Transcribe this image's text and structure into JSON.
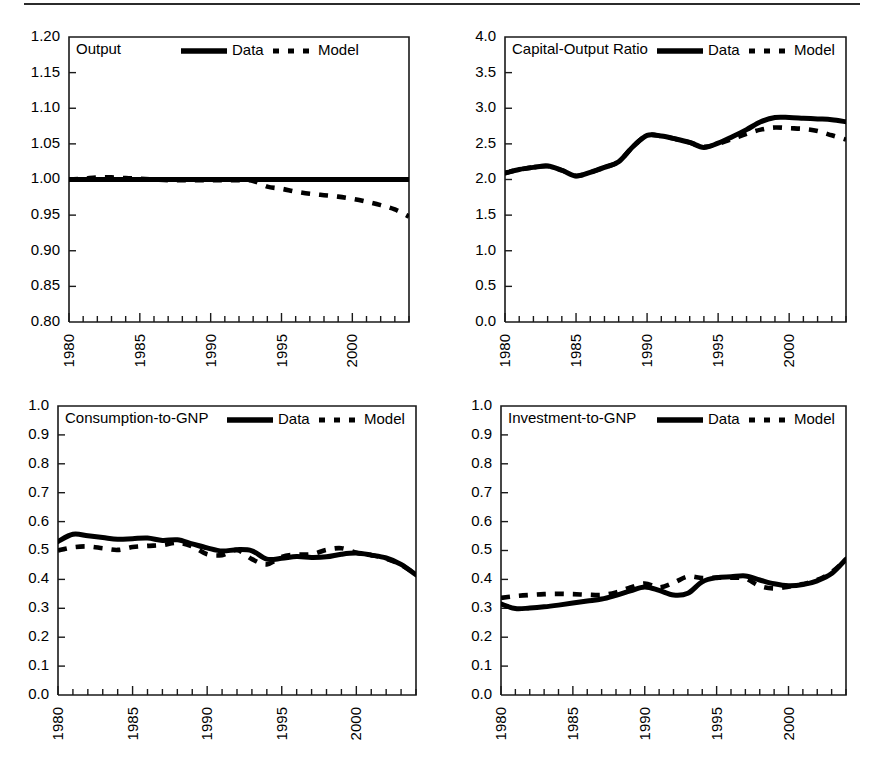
{
  "figure": {
    "top_rule": true,
    "legend": {
      "data_label": "Data",
      "model_label": "Model"
    }
  },
  "chart_data": [
    {
      "id": "output",
      "type": "line",
      "title": "Output",
      "xlabel": "",
      "ylabel": "",
      "xlim": [
        1980,
        2004
      ],
      "ylim": [
        0.8,
        1.2
      ],
      "grid": false,
      "legend_position": "top-center",
      "xticks": [
        1980,
        1985,
        1990,
        1995,
        2000
      ],
      "xtick_labels": [
        "1980",
        "1985",
        "1990",
        "1995",
        "2000"
      ],
      "yticks": [
        0.8,
        0.85,
        0.9,
        0.95,
        1.0,
        1.05,
        1.1,
        1.15,
        1.2
      ],
      "ytick_labels": [
        "0.80",
        "0.85",
        "0.90",
        "0.95",
        "1.00",
        "1.05",
        "1.10",
        "1.15",
        "1.20"
      ],
      "x": [
        1980,
        1981,
        1982,
        1983,
        1984,
        1985,
        1986,
        1987,
        1988,
        1989,
        1990,
        1991,
        1992,
        1993,
        1994,
        1995,
        1996,
        1997,
        1998,
        1999,
        2000,
        2001,
        2002,
        2003,
        2004
      ],
      "series": [
        {
          "name": "Data",
          "style": "solid",
          "values": [
            1.0,
            1.0,
            1.0,
            1.0,
            1.0,
            1.0,
            1.0,
            1.0,
            1.0,
            1.0,
            1.0,
            1.0,
            1.0,
            1.0,
            1.0,
            1.0,
            1.0,
            1.0,
            1.0,
            1.0,
            1.0,
            1.0,
            1.0,
            1.0,
            1.0
          ]
        },
        {
          "name": "Model",
          "style": "dashed",
          "values": [
            1.0,
            1.001,
            1.003,
            1.003,
            1.002,
            1.001,
            1.0,
            0.999,
            0.999,
            0.999,
            0.999,
            0.999,
            0.999,
            0.998,
            0.99,
            0.987,
            0.983,
            0.98,
            0.978,
            0.976,
            0.973,
            0.969,
            0.964,
            0.958,
            0.948
          ]
        }
      ]
    },
    {
      "id": "capital-output-ratio",
      "type": "line",
      "title": "Capital-Output Ratio",
      "xlabel": "",
      "ylabel": "",
      "xlim": [
        1980,
        2004
      ],
      "ylim": [
        0.0,
        4.0
      ],
      "grid": false,
      "legend_position": "top-right",
      "xticks": [
        1980,
        1985,
        1990,
        1995,
        2000
      ],
      "xtick_labels": [
        "1980",
        "1985",
        "1990",
        "1995",
        "2000"
      ],
      "yticks": [
        0.0,
        0.5,
        1.0,
        1.5,
        2.0,
        2.5,
        3.0,
        3.5,
        4.0
      ],
      "ytick_labels": [
        "0.0",
        "0.5",
        "1.0",
        "1.5",
        "2.0",
        "2.5",
        "3.0",
        "3.5",
        "4.0"
      ],
      "x": [
        1980,
        1981,
        1982,
        1983,
        1984,
        1985,
        1986,
        1987,
        1988,
        1989,
        1990,
        1991,
        1992,
        1993,
        1994,
        1995,
        1996,
        1997,
        1998,
        1999,
        2000,
        2001,
        2002,
        2003,
        2004
      ],
      "series": [
        {
          "name": "Data",
          "style": "solid",
          "values": [
            2.09,
            2.14,
            2.17,
            2.19,
            2.13,
            2.05,
            2.1,
            2.17,
            2.25,
            2.46,
            2.62,
            2.61,
            2.57,
            2.52,
            2.45,
            2.51,
            2.6,
            2.7,
            2.81,
            2.87,
            2.87,
            2.86,
            2.85,
            2.84,
            2.81
          ]
        },
        {
          "name": "Model",
          "style": "dashed",
          "values": [
            2.09,
            2.14,
            2.17,
            2.19,
            2.13,
            2.05,
            2.1,
            2.17,
            2.25,
            2.46,
            2.62,
            2.61,
            2.57,
            2.52,
            2.46,
            2.5,
            2.57,
            2.64,
            2.7,
            2.73,
            2.72,
            2.71,
            2.68,
            2.62,
            2.56
          ]
        }
      ]
    },
    {
      "id": "consumption-to-gnp",
      "type": "line",
      "title": "Consumption-to-GNP",
      "xlabel": "",
      "ylabel": "",
      "xlim": [
        1980,
        2004
      ],
      "ylim": [
        0.0,
        1.0
      ],
      "grid": false,
      "legend_position": "top-right",
      "xticks": [
        1980,
        1985,
        1990,
        1995,
        2000
      ],
      "xtick_labels": [
        "1980",
        "1985",
        "1990",
        "1995",
        "2000"
      ],
      "yticks": [
        0.0,
        0.1,
        0.2,
        0.3,
        0.4,
        0.5,
        0.6,
        0.7,
        0.8,
        0.9,
        1.0
      ],
      "ytick_labels": [
        "0.0",
        "0.1",
        "0.2",
        "0.3",
        "0.4",
        "0.5",
        "0.6",
        "0.7",
        "0.8",
        "0.9",
        "1.0"
      ],
      "x": [
        1980,
        1981,
        1982,
        1983,
        1984,
        1985,
        1986,
        1987,
        1988,
        1989,
        1990,
        1991,
        1992,
        1993,
        1994,
        1995,
        1996,
        1997,
        1998,
        1999,
        2000,
        2001,
        2002,
        2003,
        2004
      ],
      "series": [
        {
          "name": "Data",
          "style": "solid",
          "values": [
            0.531,
            0.556,
            0.551,
            0.545,
            0.539,
            0.541,
            0.543,
            0.535,
            0.537,
            0.523,
            0.509,
            0.498,
            0.503,
            0.499,
            0.47,
            0.473,
            0.479,
            0.476,
            0.478,
            0.487,
            0.491,
            0.484,
            0.474,
            0.452,
            0.416
          ]
        },
        {
          "name": "Model",
          "style": "dashed",
          "values": [
            0.5,
            0.511,
            0.514,
            0.508,
            0.502,
            0.512,
            0.516,
            0.519,
            0.527,
            0.514,
            0.487,
            0.484,
            0.502,
            0.47,
            0.452,
            0.478,
            0.486,
            0.487,
            0.502,
            0.508,
            0.492,
            0.484,
            0.472,
            0.45,
            0.417
          ]
        }
      ]
    },
    {
      "id": "investment-to-gnp",
      "type": "line",
      "title": "Investment-to-GNP",
      "xlabel": "",
      "ylabel": "",
      "xlim": [
        1980,
        2004
      ],
      "ylim": [
        0.0,
        1.0
      ],
      "grid": false,
      "legend_position": "top-right",
      "xticks": [
        1980,
        1985,
        1990,
        1995,
        2000
      ],
      "xtick_labels": [
        "1980",
        "1985",
        "1990",
        "1995",
        "2000"
      ],
      "yticks": [
        0.0,
        0.1,
        0.2,
        0.3,
        0.4,
        0.5,
        0.6,
        0.7,
        0.8,
        0.9,
        1.0
      ],
      "ytick_labels": [
        "0.0",
        "0.1",
        "0.2",
        "0.3",
        "0.4",
        "0.5",
        "0.6",
        "0.7",
        "0.8",
        "0.9",
        "1.0"
      ],
      "x": [
        1980,
        1981,
        1982,
        1983,
        1984,
        1985,
        1986,
        1987,
        1988,
        1989,
        1990,
        1991,
        1992,
        1993,
        1994,
        1995,
        1996,
        1997,
        1998,
        1999,
        2000,
        2001,
        2002,
        2003,
        2004
      ],
      "series": [
        {
          "name": "Data",
          "style": "solid",
          "values": [
            0.315,
            0.299,
            0.301,
            0.305,
            0.311,
            0.318,
            0.325,
            0.332,
            0.345,
            0.36,
            0.374,
            0.362,
            0.346,
            0.352,
            0.392,
            0.406,
            0.409,
            0.412,
            0.398,
            0.385,
            0.378,
            0.382,
            0.395,
            0.42,
            0.47
          ]
        },
        {
          "name": "Model",
          "style": "dashed",
          "values": [
            0.336,
            0.342,
            0.346,
            0.349,
            0.35,
            0.349,
            0.347,
            0.346,
            0.355,
            0.372,
            0.386,
            0.372,
            0.388,
            0.41,
            0.405,
            0.406,
            0.406,
            0.403,
            0.377,
            0.369,
            0.375,
            0.384,
            0.398,
            0.425,
            0.468
          ]
        }
      ]
    }
  ]
}
